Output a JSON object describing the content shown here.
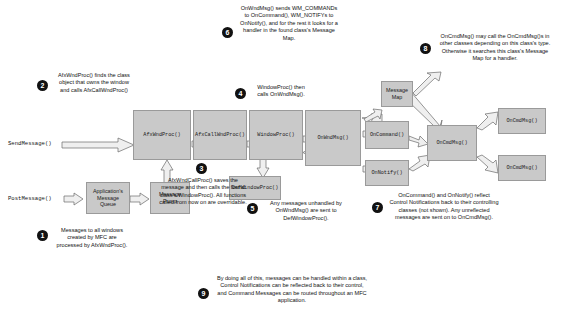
{
  "diagram": {
    "boxes": [
      {
        "id": "app_msg_queue",
        "label": "Application's\nMessage\nQueue"
      },
      {
        "id": "message_pump",
        "label": "Message\nPump"
      },
      {
        "id": "afx_wnd_proc",
        "label": "AfxWndProc()"
      },
      {
        "id": "afx_call_wnd_proc",
        "label": "AfxCallWndProc()"
      },
      {
        "id": "window_proc",
        "label": "WindowProc()"
      },
      {
        "id": "on_wnd_msg",
        "label": "OnWndMsg()"
      },
      {
        "id": "def_window_proc",
        "label": "DefWindowProc()"
      },
      {
        "id": "on_command",
        "label": "OnCommand()"
      },
      {
        "id": "on_notify",
        "label": "OnNotify()"
      },
      {
        "id": "message_map",
        "label": "Message\nMap"
      },
      {
        "id": "on_cmd_msg",
        "label": "OnCmdMsg()"
      },
      {
        "id": "on_cmd_msg_other_1",
        "label": "OnCmdMsg()"
      },
      {
        "id": "on_cmd_msg_other_2",
        "label": "OnCmdMsg()"
      }
    ],
    "entry_labels": [
      {
        "id": "send_message",
        "label": "SendMessage()"
      },
      {
        "id": "post_message",
        "label": "PostMessage()"
      }
    ],
    "callouts": [
      {
        "number": "1",
        "text": "Messages to all windows created by MFC are processed by AfxWndProc()."
      },
      {
        "number": "2",
        "text": "AfxWndProc() finds the class object that owns the window and calls AfxCallWndProc()"
      },
      {
        "number": "3",
        "text": "AfxWndCallProc() saves the message and then calls the found class's WindowProc(). All functions called from now on are overridable."
      },
      {
        "number": "4",
        "text": "WindowProc() then calls OnWndMsg()."
      },
      {
        "number": "5",
        "text": "Any messages unhandled by OnWndMsg() are sent to DefWindowProc()."
      },
      {
        "number": "6",
        "text": "OnWndMsg() sends WM_COMMANDs to OnCommand(), WM_NOTIFYs to OnNotify(), and for the rest it looks for a handler in the found class's Message Map."
      },
      {
        "number": "7",
        "text": "OnCommand() and OnNotify() reflect Control Notifications back to their controlling classes (not shown). Any unreflected messages are sent on to OnCmdMsg()."
      },
      {
        "number": "8",
        "text": "OnCmdMsg() may call the OnCmdMsg()s in other classes depending on this class's type. Otherwise it searches this class's Message Map for a handler."
      },
      {
        "number": "9",
        "text": "By doing all of this, messages can be handled within a class, Control Notifications can be reflected back to their control, and Command Messages can be routed throughout an MFC application."
      }
    ],
    "colors": {
      "box_fill": "#c9c9c9",
      "box_border": "#9a9a9a",
      "arrow_fill": "#e8e8e8",
      "arrow_stroke": "#6a6a6a",
      "text": "#111111"
    }
  }
}
